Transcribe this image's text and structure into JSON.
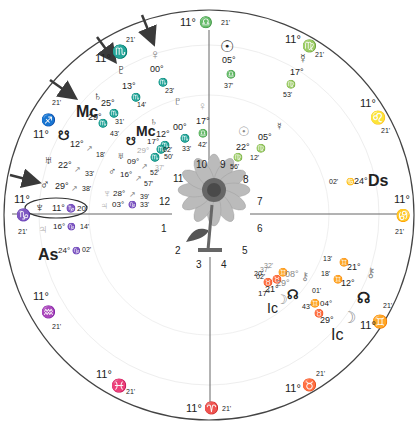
{
  "chart": {
    "center_image": "sunflower",
    "colors": {
      "outer_ring": "#444444",
      "axis": "#555555",
      "natal_text": "#222222",
      "transit_text": "#8a8a8a",
      "arrow": "#3a3a3a",
      "highlight_ellipse": "#333333"
    },
    "cusps": [
      {
        "deg": "11°",
        "sign": "♎",
        "min": "21'",
        "name": "libra"
      },
      {
        "deg": "11°",
        "sign": "♍",
        "min": "21'",
        "name": "virgo"
      },
      {
        "deg": "11°",
        "sign": "♌",
        "min": "21'",
        "name": "leo"
      },
      {
        "deg": "11°",
        "sign": "♋",
        "min": "21'",
        "name": "cancer"
      },
      {
        "deg": "11°",
        "sign": "♊",
        "min": "21'",
        "name": "gemini"
      },
      {
        "deg": "11°",
        "sign": "♉",
        "min": "21'",
        "name": "taurus"
      },
      {
        "deg": "11°",
        "sign": "♈",
        "min": "21'",
        "name": "aries"
      },
      {
        "deg": "11°",
        "sign": "♓",
        "min": "21'",
        "name": "pisces"
      },
      {
        "deg": "11°",
        "sign": "♒",
        "min": "21'",
        "name": "aquarius"
      },
      {
        "deg": "11°",
        "sign": "♑",
        "min": "21'",
        "name": "capricorn"
      },
      {
        "deg": "11°",
        "sign": "♐",
        "min": "21'",
        "name": "sagittarius"
      },
      {
        "deg": "11°",
        "sign": "♏",
        "min": "21'",
        "name": "scorpio"
      }
    ],
    "houses": [
      "1",
      "2",
      "3",
      "4",
      "5",
      "6",
      "7",
      "8",
      "9",
      "10",
      "11",
      "12"
    ],
    "natal_planets": [
      {
        "name": "venus",
        "glyph": "♀",
        "deg": "00°",
        "sign": "♏",
        "min": "23'"
      },
      {
        "name": "pluto",
        "glyph": "♇",
        "deg": "13°",
        "sign": "♏",
        "min": "14'"
      },
      {
        "name": "saturn",
        "glyph": "♄",
        "deg": "25°",
        "sign": "♏",
        "min": "31'"
      },
      {
        "name": "midheaven",
        "glyph": "Mc",
        "deg": "29°",
        "sign": "♏",
        "min": "43'"
      },
      {
        "name": "south-node",
        "glyph": "☋",
        "deg": "12°",
        "sign": "♐",
        "min": "18'"
      },
      {
        "name": "uranus",
        "glyph": "♅",
        "deg": "22°",
        "sign": "♐",
        "min": "33'"
      },
      {
        "name": "mars",
        "glyph": "♂",
        "deg": "29°",
        "sign": "♐",
        "min": "38'"
      },
      {
        "name": "neptune",
        "glyph": "♆",
        "deg": "11°",
        "sign": "♑",
        "min": "20'"
      },
      {
        "name": "jupiter",
        "glyph": "♃",
        "deg": "16°",
        "sign": "♑",
        "min": "14'"
      },
      {
        "name": "ascendant",
        "glyph": "As",
        "deg": "24°",
        "sign": "♑",
        "min": "02'"
      },
      {
        "name": "sun",
        "glyph": "☉",
        "deg": "05°",
        "sign": "♎",
        "min": "37'"
      },
      {
        "name": "mercury",
        "glyph": "☿",
        "deg": "17°",
        "sign": "♍",
        "min": "53'"
      },
      {
        "name": "descendant",
        "glyph": "Ds",
        "deg": "24°",
        "sign": "♋",
        "min": "02'"
      },
      {
        "name": "chiron",
        "glyph": "⚷",
        "deg": "21°",
        "sign": "♊",
        "min": "13'"
      },
      {
        "name": "north-node",
        "glyph": "☊",
        "deg": "12°",
        "sign": "♊",
        "min": "18'"
      },
      {
        "name": "moon",
        "glyph": "☽",
        "deg": "29°",
        "sign": "♉",
        "min": "43'"
      },
      {
        "name": "imum-coeli",
        "glyph": "Ic",
        "deg": "",
        "sign": "",
        "min": ""
      }
    ],
    "transit_planets": [
      {
        "name": "pluto-transit",
        "glyph": "♇",
        "deg": "00°",
        "sign": "♏",
        "min": "33'"
      },
      {
        "name": "venus-transit",
        "glyph": "♀",
        "deg": "17°",
        "sign": "♎",
        "min": "42'"
      },
      {
        "name": "saturn-transit",
        "glyph": "♄",
        "deg": "12°",
        "sign": "♏",
        "min": "50'"
      },
      {
        "name": "midheaven-transit",
        "glyph": "Mc",
        "deg": "17°",
        "sign": "♏",
        "min": "02'"
      },
      {
        "name": "south-node-transit",
        "glyph": "☋",
        "deg": "29°",
        "sign": "♏",
        "min": "37'"
      },
      {
        "name": "uranus-transit",
        "glyph": "♅",
        "deg": "09°",
        "sign": "♐",
        "min": "52'"
      },
      {
        "name": "mars-transit",
        "glyph": "♂",
        "deg": "16°",
        "sign": "♐",
        "min": "57'"
      },
      {
        "name": "neptune-transit",
        "glyph": "♆",
        "deg": "28°",
        "sign": "♐",
        "min": "39'"
      },
      {
        "name": "jupiter-transit",
        "glyph": "♃",
        "deg": "03°",
        "sign": "♑",
        "min": "33'"
      },
      {
        "name": "sun-transit",
        "glyph": "☉",
        "deg": "22°",
        "sign": "♍",
        "min": "56'"
      },
      {
        "name": "mercury-transit",
        "glyph": "☿",
        "deg": "05°",
        "sign": "♍",
        "min": "12'"
      },
      {
        "name": "chiron-transit",
        "glyph": "⚷",
        "deg": "08°",
        "sign": "♊",
        "min": "32'"
      },
      {
        "name": "north-node-transit",
        "glyph": "☊",
        "deg": "29°",
        "sign": "♉",
        "min": "37'"
      },
      {
        "name": "moon-transit",
        "glyph": "☽",
        "deg": "21°",
        "sign": "♉",
        "min": "20'"
      },
      {
        "name": "imum-coeli-transit",
        "glyph": "Ic",
        "deg": "17°",
        "sign": "♉",
        "min": "02'"
      }
    ],
    "extra_labels": {
      "natal_moon_deg2": "04°",
      "natal_moon_min2": "01'",
      "chiron_sign_small": "♊",
      "node_sign_small": "♊"
    }
  }
}
